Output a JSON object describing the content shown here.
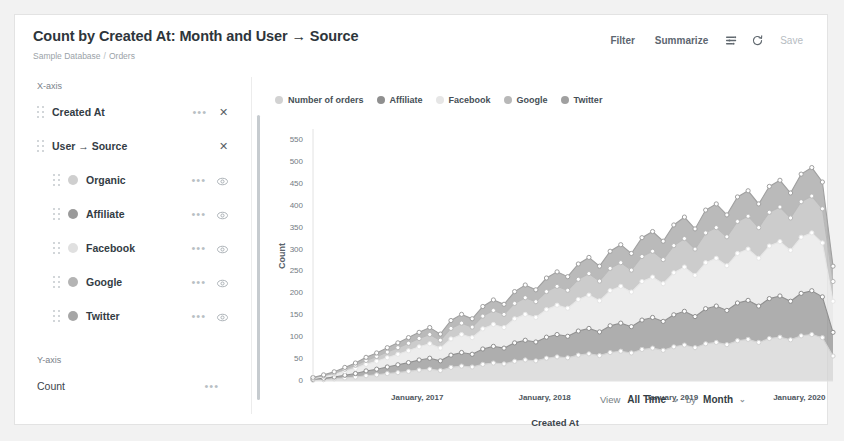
{
  "header": {
    "title": "Count by Created At: Month and User → Source",
    "breadcrumb_db": "Sample Database",
    "breadcrumb_sep": "/",
    "breadcrumb_table": "Orders"
  },
  "toolbar": {
    "filter_label": "Filter",
    "summarize_label": "Summarize",
    "settings_icon": "sliders-icon",
    "refresh_icon": "refresh-icon",
    "save_label": "Save"
  },
  "sidebar": {
    "x_axis_label": "X-axis",
    "y_axis_label": "Y-axis",
    "x_items": [
      {
        "label": "Created At",
        "has_menu": true,
        "has_remove": true
      },
      {
        "label": "User → Source",
        "has_menu": false,
        "has_remove": true
      }
    ],
    "series": [
      {
        "label": "Organic",
        "color": "#cfcfcf"
      },
      {
        "label": "Affiliate",
        "color": "#9a9a9a"
      },
      {
        "label": "Facebook",
        "color": "#e0e0e0"
      },
      {
        "label": "Google",
        "color": "#b4b4b4"
      },
      {
        "label": "Twitter",
        "color": "#a6a6a6"
      }
    ],
    "y_items": [
      {
        "label": "Count",
        "has_menu": true
      }
    ]
  },
  "chart_data": {
    "type": "area",
    "stacked": true,
    "title": "Count by Created At: Month and User → Source",
    "xlabel": "Created At",
    "ylabel": "Count",
    "ylim": [
      0,
      575
    ],
    "yticks": [
      0,
      50,
      100,
      150,
      200,
      250,
      300,
      350,
      400,
      450,
      500,
      550
    ],
    "grid": false,
    "legend_position": "top",
    "legend": [
      "Number of orders",
      "Affiliate",
      "Facebook",
      "Google",
      "Twitter"
    ],
    "xtick_labels": [
      "January, 2017",
      "January, 2018",
      "January, 2019",
      "January, 2020"
    ],
    "xtick_indices": [
      10,
      22,
      34,
      46
    ],
    "x": [
      "2016-03",
      "2016-04",
      "2016-05",
      "2016-06",
      "2016-07",
      "2016-08",
      "2016-09",
      "2016-10",
      "2016-11",
      "2016-12",
      "2017-01",
      "2017-02",
      "2017-03",
      "2017-04",
      "2017-05",
      "2017-06",
      "2017-07",
      "2017-08",
      "2017-09",
      "2017-10",
      "2017-11",
      "2017-12",
      "2018-01",
      "2018-02",
      "2018-03",
      "2018-04",
      "2018-05",
      "2018-06",
      "2018-07",
      "2018-08",
      "2018-09",
      "2018-10",
      "2018-11",
      "2018-12",
      "2019-01",
      "2019-02",
      "2019-03",
      "2019-04",
      "2019-05",
      "2019-06",
      "2019-07",
      "2019-08",
      "2019-09",
      "2019-10",
      "2019-11",
      "2019-12",
      "2020-01",
      "2020-02",
      "2020-03",
      "2020-04"
    ],
    "series": [
      {
        "name": "Number of orders",
        "color": "#d2d2d2",
        "values": [
          2,
          3,
          5,
          7,
          9,
          12,
          14,
          17,
          19,
          22,
          25,
          27,
          24,
          31,
          34,
          32,
          38,
          41,
          39,
          45,
          48,
          46,
          52,
          55,
          53,
          59,
          62,
          58,
          65,
          68,
          64,
          72,
          75,
          70,
          78,
          82,
          76,
          85,
          88,
          83,
          92,
          95,
          88,
          97,
          100,
          94,
          103,
          106,
          99,
          57
        ]
      },
      {
        "name": "Affiliate",
        "color": "#8f8f8f",
        "values": [
          2,
          3,
          4,
          6,
          8,
          11,
          13,
          15,
          18,
          20,
          23,
          25,
          22,
          28,
          31,
          29,
          35,
          38,
          36,
          42,
          45,
          43,
          48,
          51,
          49,
          55,
          58,
          54,
          61,
          64,
          60,
          67,
          70,
          66,
          73,
          77,
          71,
          80,
          83,
          78,
          86,
          89,
          83,
          91,
          94,
          88,
          97,
          100,
          93,
          54
        ]
      },
      {
        "name": "Facebook",
        "color": "#e6e6e6",
        "values": [
          2,
          4,
          6,
          9,
          12,
          15,
          18,
          21,
          24,
          27,
          30,
          33,
          29,
          37,
          41,
          38,
          46,
          50,
          47,
          55,
          59,
          56,
          63,
          67,
          64,
          72,
          76,
          71,
          80,
          84,
          79,
          88,
          92,
          86,
          96,
          101,
          94,
          105,
          109,
          102,
          113,
          117,
          109,
          120,
          124,
          116,
          128,
          132,
          123,
          71
        ]
      },
      {
        "name": "Google",
        "color": "#b8b8b8",
        "values": [
          1,
          2,
          3,
          5,
          7,
          9,
          11,
          13,
          15,
          17,
          19,
          21,
          18,
          24,
          26,
          24,
          29,
          32,
          30,
          35,
          38,
          36,
          41,
          43,
          41,
          46,
          49,
          45,
          51,
          54,
          50,
          57,
          59,
          55,
          62,
          65,
          60,
          68,
          70,
          66,
          73,
          75,
          70,
          77,
          79,
          74,
          81,
          84,
          78,
          45
        ]
      },
      {
        "name": "Twitter",
        "color": "#a0a0a0",
        "values": [
          1,
          2,
          3,
          4,
          5,
          7,
          8,
          10,
          11,
          13,
          14,
          16,
          14,
          18,
          20,
          19,
          22,
          24,
          23,
          27,
          29,
          27,
          31,
          33,
          31,
          35,
          37,
          34,
          39,
          41,
          38,
          43,
          45,
          42,
          47,
          49,
          46,
          52,
          54,
          50,
          56,
          58,
          54,
          59,
          61,
          57,
          63,
          65,
          61,
          35
        ]
      }
    ]
  },
  "footer": {
    "view_label": "View",
    "range_value": "All Time",
    "by_label": "by",
    "unit_value": "Month",
    "caret": "⌄"
  },
  "colors": {
    "card_bg": "#ffffff",
    "page_bg": "#f2f2f2",
    "text_primary": "#2e353b",
    "text_muted": "#9aa2a8",
    "border": "#e3e3e3"
  }
}
